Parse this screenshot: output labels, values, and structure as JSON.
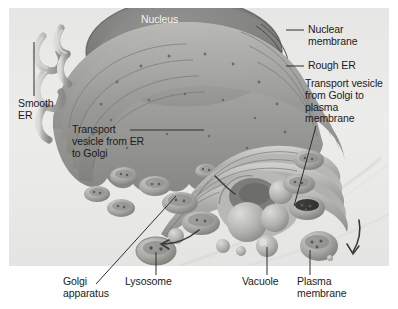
{
  "figure": {
    "panel_color": "#ececeb",
    "label_color": "#1b1b1b",
    "white_label_color": "#f2f2f2",
    "leader_color": "#3a3a3a"
  },
  "labels": {
    "nucleus": "Nucleus",
    "nuclear_membrane": "Nuclear\nmembrane",
    "rough_er": "Rough ER",
    "transport_vesicle_golgi_to_plasma": "Transport vesicle\nfrom Golgi to\nplasma\nmembrane",
    "smooth_er": "Smooth\nER",
    "transport_vesicle_er_to_golgi": "Transport\nvesicle from ER\nto Golgi",
    "golgi_apparatus": "Golgi\napparatus",
    "lysosome": "Lysosome",
    "vacuole": "Vacuole",
    "plasma_membrane": "Plasma\nmembrane"
  },
  "structures": [
    {
      "name": "nucleus",
      "description": "dark round nucleus at top center"
    },
    {
      "name": "nuclear-membrane",
      "description": "double membrane bounding the nucleus"
    },
    {
      "name": "rough-er",
      "description": "ribosome studded folded sheets around nucleus"
    },
    {
      "name": "smooth-er",
      "description": "tubular network at left edge"
    },
    {
      "name": "golgi-apparatus",
      "description": "stacked flattened cisternae at center"
    },
    {
      "name": "lysosome",
      "description": "small round vesicle lower center-left"
    },
    {
      "name": "vacuole",
      "description": "small smooth sphere lower center"
    },
    {
      "name": "plasma-membrane",
      "description": "cell surface arc at lower right"
    },
    {
      "name": "transport-vesicle",
      "description": "small budding vesicles between organelles"
    }
  ]
}
